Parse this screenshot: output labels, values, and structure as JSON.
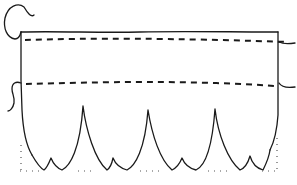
{
  "diagram": {
    "type": "line-drawing",
    "colors": {
      "background": "#ffffff",
      "ink": "#1a1a1a",
      "dots": "#555555"
    },
    "panel": {
      "top_y": 32,
      "left_x": 21,
      "right_x": 278
    },
    "dashed_lines": [
      {
        "name": "upper-stitch-line",
        "y": 40
      },
      {
        "name": "lower-stitch-line",
        "y": 83
      }
    ],
    "scallops": {
      "count": 4,
      "tall_points_x": [
        21,
        83,
        148,
        215,
        278
      ],
      "small_points_x": [
        51,
        113,
        183,
        250
      ],
      "bottom_y": 170
    },
    "dotted_baseline_y": 171
  }
}
